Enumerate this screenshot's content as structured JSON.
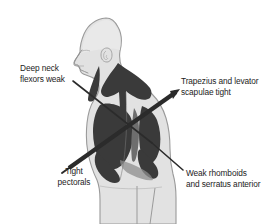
{
  "diagram": {
    "type": "anatomical-illustration",
    "view": "lateral side profile, facing left",
    "colors": {
      "background": "#ffffff",
      "body_fill": "#e2e2e2",
      "body_outline": "#9a9a9a",
      "muscle_shaded": "#3a3a3a",
      "muscle_mid": "#6e6e6e",
      "line_color": "#2b2b2b",
      "text_color": "#1c1c1c"
    },
    "labels": {
      "deep_neck": {
        "line1": "Deep neck",
        "line2": "flexors weak",
        "pointer": "thin-line-down-right",
        "condition": "weak"
      },
      "trapezius": {
        "line1": "Trapezius and levator",
        "line2": "scapulae tight",
        "pointer": "thick-arrow-down-left",
        "condition": "tight"
      },
      "tight_pectorals": {
        "line1": "Tight",
        "line2": "pectorals",
        "pointer": "thick-line-up-right",
        "condition": "tight"
      },
      "weak_rhomboids": {
        "line1": "Weak rhomboids",
        "line2": "and serratus anterior",
        "pointer": "thin-line-up-left",
        "condition": "weak"
      }
    },
    "icons": {
      "arrowhead": "arrow-icon",
      "pointer_line": "leader-line-icon"
    }
  }
}
